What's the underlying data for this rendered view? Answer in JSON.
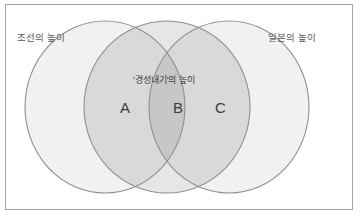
{
  "figure": {
    "type": "venn-diagram",
    "background_color": "#ffffff",
    "frame_border_color": "#a6a6a6"
  },
  "labels": {
    "left_circle": "조선의 높이",
    "right_circle": "일본의 높이",
    "center_circle": "'경성내기'의 높이"
  },
  "regions": [
    {
      "id": "A",
      "letter": "A",
      "description": "left-center-overlap"
    },
    {
      "id": "B",
      "letter": "B",
      "description": "triple-overlap"
    },
    {
      "id": "C",
      "letter": "C",
      "description": "center-right-overlap"
    }
  ],
  "circles": [
    {
      "name": "left",
      "cx": 105,
      "cy": 107,
      "rx": 80,
      "ry": 86,
      "fill": "#f1f1f1",
      "stroke": "#8c8c8c"
    },
    {
      "name": "center",
      "cx": 167,
      "cy": 107,
      "rx": 83,
      "ry": 86,
      "fill": "#e3e3e3",
      "stroke": "#8c8c8c"
    },
    {
      "name": "right",
      "cx": 229,
      "cy": 107,
      "rx": 80,
      "ry": 86,
      "fill": "#f1f1f1",
      "stroke": "#8c8c8c"
    }
  ],
  "colors": {
    "single_fill": "#f1f1f1",
    "double_overlap_fill": "#d9d9d9",
    "triple_overlap_fill": "#c7c7c7",
    "stroke": "#8c8c8c",
    "text": "#4a4a4a"
  }
}
